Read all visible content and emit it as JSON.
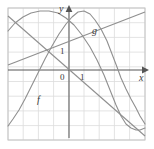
{
  "figure": {
    "kind": "cartesian-plot",
    "background": "#ffffff",
    "frame_color": "#c8c8c8",
    "grid_color": "#d9d9d9",
    "axis_color": "#555555",
    "curve_color": "#8a8a8a",
    "text_color": "#3a3a3a"
  },
  "axes": {
    "x_label": "x",
    "y_label": "y",
    "origin_label": "0",
    "x_unit_label": "1",
    "y_unit_label": "1",
    "x_axis_y_px": 70,
    "y_axis_x_px": 69,
    "cell_px": 14.7,
    "frame": {
      "left": 8,
      "top": 8,
      "right": 145,
      "bottom": 140
    },
    "grid": {
      "columns": 9,
      "rows": 9,
      "visible": true
    }
  },
  "curves": [
    {
      "name": "f",
      "label": "f",
      "label_pos_px": {
        "x": 38,
        "y": 97
      },
      "type": "sinusoid",
      "description": "cosine-like wave, maximum near the y-axis top, minimum near x=0.6 units right",
      "points_px": "8,31 15,23 23,17 31,13 40,11 49,11 58,13 66,18 74,25 82,35 90,47 97,60 104,75 110,90 116,105 121,116 126,124 131,128 136,130 140,130 145,128"
    },
    {
      "name": "g",
      "label": "g",
      "label_pos_px": {
        "x": 93,
        "y": 27
      },
      "type": "sinusoid",
      "description": "second wave peaking left of the y-axis, descending through the axis crossing near x=118",
      "points_px": "8,126 13,119 19,110 25,99 31,87 38,73 45,59 52,46 59,34 66,24 72,17 78,12 84,11 90,14 95,20 101,29 107,41 112,54 117,67 121,78 126,89 131,99 136,108 140,116 145,124"
    },
    {
      "name": "line-up",
      "label": "",
      "type": "line",
      "description": "straight line rising left-to-right through the lower-left and upper-right",
      "points_px": "8,65 145,12"
    },
    {
      "name": "line-down",
      "label": "",
      "type": "line",
      "description": "straight line falling left-to-right crossing the rising line near x=27",
      "points_px": "8,16 145,136"
    }
  ],
  "labels": {
    "y_axis": "y",
    "x_axis": "x",
    "origin": "0",
    "one_x": "1",
    "one_y": "1",
    "curve_f": "f",
    "curve_g": "g"
  }
}
